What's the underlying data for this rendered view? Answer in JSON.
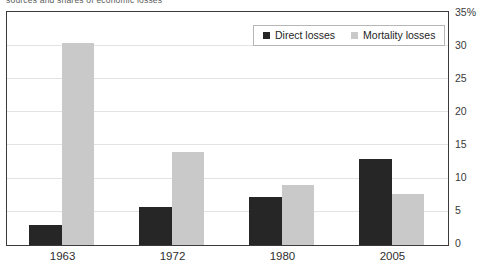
{
  "caption": {
    "text": "sources and shares of economic losses"
  },
  "chart_data": {
    "type": "bar",
    "title": "",
    "subtitle": "",
    "xlabel": "",
    "ylabel": "",
    "categories": [
      "1963",
      "1972",
      "1980",
      "2005"
    ],
    "series": [
      {
        "name": "Direct losses",
        "color": "#262626",
        "values": [
          3.0,
          5.8,
          7.2,
          13.0
        ]
      },
      {
        "name": "Mortality losses",
        "color": "#c9c9c9",
        "values": [
          30.5,
          14.0,
          9.0,
          7.7
        ]
      }
    ],
    "ylim": [
      0,
      35
    ],
    "yticks": [
      0,
      5,
      10,
      15,
      20,
      25,
      30,
      35
    ],
    "ytick_labels": [
      "0",
      "5",
      "10",
      "15",
      "20",
      "25",
      "30",
      "35%"
    ],
    "y_axis_position": "right",
    "grid": true,
    "grid_axis": "y",
    "legend_position": "top-right",
    "bar_gap_within_group": 0,
    "frame": true
  },
  "legend": {
    "items": [
      {
        "label": "Direct losses",
        "swatch": "dark-square-icon"
      },
      {
        "label": "Mortality losses",
        "swatch": "light-square-icon"
      }
    ]
  },
  "colors": {
    "direct": "#262626",
    "mortality": "#c9c9c9",
    "frame": "#3a3a3a",
    "grid": "#e3e3e3",
    "text": "#2e2e2e",
    "background": "#ffffff"
  }
}
